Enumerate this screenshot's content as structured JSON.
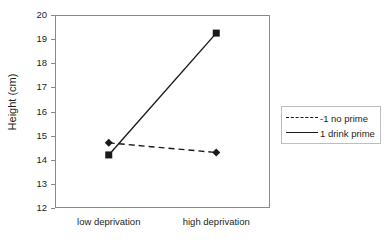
{
  "chart_data": {
    "type": "line",
    "title": "",
    "xlabel": "",
    "ylabel": "Height (cm)",
    "categories": [
      "low deprivation",
      "high deprivation"
    ],
    "ylim": [
      12,
      20
    ],
    "yticks": [
      12,
      13,
      14,
      15,
      16,
      17,
      18,
      19,
      20
    ],
    "ytick_labels": [
      "12",
      "13",
      "14",
      "15",
      "16",
      "17",
      "18",
      "19",
      "20"
    ],
    "grid": false,
    "legend_position": "right",
    "series": [
      {
        "name": "-1 no prime",
        "values": [
          14.7,
          14.3
        ],
        "line_style": "dashed",
        "marker": "diamond",
        "color": "#1a1a1a"
      },
      {
        "name": "1 drink prime",
        "values": [
          14.2,
          19.25
        ],
        "line_style": "solid",
        "marker": "square",
        "color": "#1a1a1a"
      }
    ]
  },
  "legend": {
    "items": [
      {
        "label": "-1 no prime"
      },
      {
        "label": "1 drink prime"
      }
    ]
  },
  "axes": {
    "y_title": "Height (cm)",
    "x_labels": [
      "low deprivation",
      "high deprivation"
    ],
    "y_labels": [
      "20",
      "19",
      "18",
      "17",
      "16",
      "15",
      "14",
      "13",
      "12"
    ]
  },
  "colors": {
    "frame": "#8a8a8a",
    "series": "#1a1a1a",
    "text": "#231f20",
    "legend_border": "#bdbdbd",
    "background": "#ffffff"
  }
}
